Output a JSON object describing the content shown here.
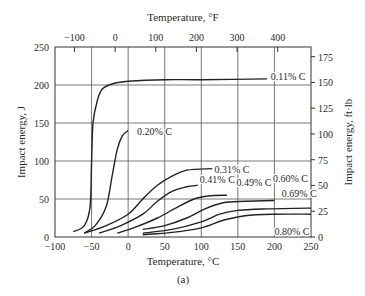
{
  "chart_data": {
    "type": "line",
    "title": "",
    "caption": "(a)",
    "xlabel": "Temperature, °C",
    "x2label": "Temperature, °F",
    "ylabel": "Impact energy, J",
    "y2label": "Impact energy, ft·lb",
    "xlim": [
      -100,
      250
    ],
    "ylim": [
      0,
      250
    ],
    "x_ticks": [
      -100,
      -50,
      0,
      50,
      100,
      150,
      200,
      250
    ],
    "y_ticks": [
      0,
      50,
      100,
      150,
      200,
      250
    ],
    "x2_ticks": [
      -100,
      0,
      100,
      200,
      300,
      400
    ],
    "y2_ticks": [
      0,
      25,
      50,
      75,
      100,
      125,
      150,
      175
    ],
    "grid": true,
    "legend": "inline labels",
    "series": [
      {
        "name": "0.11% C",
        "x": [
          -75,
          -60,
          -52,
          -50,
          -48,
          -42,
          -35,
          -20,
          0,
          50,
          100,
          190
        ],
        "y": [
          7,
          15,
          40,
          100,
          150,
          180,
          195,
          202,
          205,
          207,
          207,
          208
        ]
      },
      {
        "name": "0.20% C",
        "x": [
          -60,
          -45,
          -30,
          -22,
          -15,
          -8,
          0
        ],
        "y": [
          5,
          15,
          40,
          80,
          115,
          133,
          140
        ]
      },
      {
        "name": "0.31% C",
        "x": [
          -60,
          -30,
          0,
          20,
          40,
          60,
          80,
          115
        ],
        "y": [
          5,
          15,
          30,
          50,
          68,
          80,
          88,
          90
        ]
      },
      {
        "name": "0.41% C",
        "x": [
          -40,
          -10,
          20,
          40,
          60,
          80,
          95
        ],
        "y": [
          5,
          15,
          30,
          47,
          60,
          66,
          68
        ]
      },
      {
        "name": "0.49% C",
        "x": [
          -15,
          10,
          40,
          65,
          90,
          110,
          135
        ],
        "y": [
          5,
          13,
          25,
          38,
          50,
          54,
          55
        ]
      },
      {
        "name": "0.60% C",
        "x": [
          20,
          50,
          80,
          105,
          130,
          160,
          200
        ],
        "y": [
          10,
          15,
          25,
          37,
          45,
          47,
          48
        ]
      },
      {
        "name": "0.69% C",
        "x": [
          20,
          60,
          100,
          125,
          150,
          190,
          250
        ],
        "y": [
          5,
          10,
          20,
          30,
          35,
          37,
          38
        ]
      },
      {
        "name": "0.80% C",
        "x": [
          20,
          60,
          100,
          130,
          160,
          200,
          250
        ],
        "y": [
          3,
          6,
          12,
          22,
          28,
          30,
          30
        ]
      }
    ],
    "annotations": [
      {
        "text": "0.11% C",
        "x": 195,
        "y": 212
      },
      {
        "text": "0.20% C",
        "x": 12,
        "y": 140
      },
      {
        "text": "0.31% C",
        "x": 118,
        "y": 90
      },
      {
        "text": "0.41% C",
        "x": 98,
        "y": 76
      },
      {
        "text": "0.49% C",
        "x": 148,
        "y": 73
      },
      {
        "text": "0.60% C",
        "x": 198,
        "y": 78
      },
      {
        "text": "0.69% C",
        "x": 210,
        "y": 58
      },
      {
        "text": "0.80% C",
        "x": 200,
        "y": 8
      }
    ]
  },
  "labels": {
    "top_axis_title": "Temperature, °F",
    "bottom_axis_title": "Temperature, °C",
    "left_axis_title": "Impact energy, J",
    "right_axis_title": "Impact energy, ft·lb",
    "caption": "(a)"
  }
}
